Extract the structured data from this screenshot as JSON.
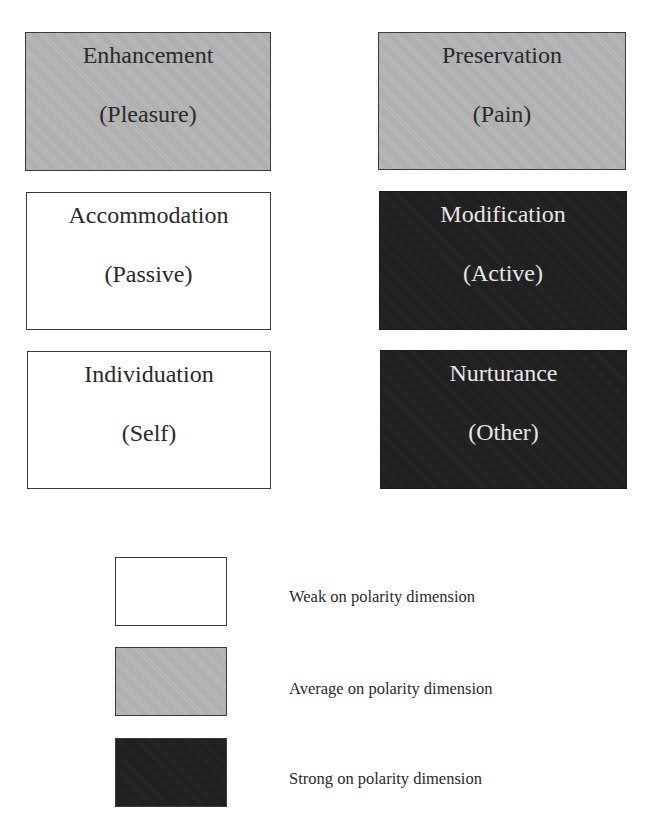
{
  "diagram": {
    "type": "polarity-grid",
    "colors": {
      "weak": "#ffffff",
      "average": "#b4b4b4",
      "strong": "#1f1f1f"
    },
    "boxes": [
      {
        "title": "Enhancement",
        "subtitle": "(Pleasure)",
        "strength": "average"
      },
      {
        "title": "Preservation",
        "subtitle": "(Pain)",
        "strength": "average"
      },
      {
        "title": "Accommodation",
        "subtitle": "(Passive)",
        "strength": "weak"
      },
      {
        "title": "Modification",
        "subtitle": "(Active)",
        "strength": "strong"
      },
      {
        "title": "Individuation",
        "subtitle": "(Self)",
        "strength": "weak"
      },
      {
        "title": "Nurturance",
        "subtitle": "(Other)",
        "strength": "strong"
      }
    ],
    "legend": [
      {
        "strength": "weak",
        "label": "Weak on polarity dimension"
      },
      {
        "strength": "average",
        "label": "Average on polarity dimension"
      },
      {
        "strength": "strong",
        "label": "Strong on polarity dimension"
      }
    ]
  }
}
